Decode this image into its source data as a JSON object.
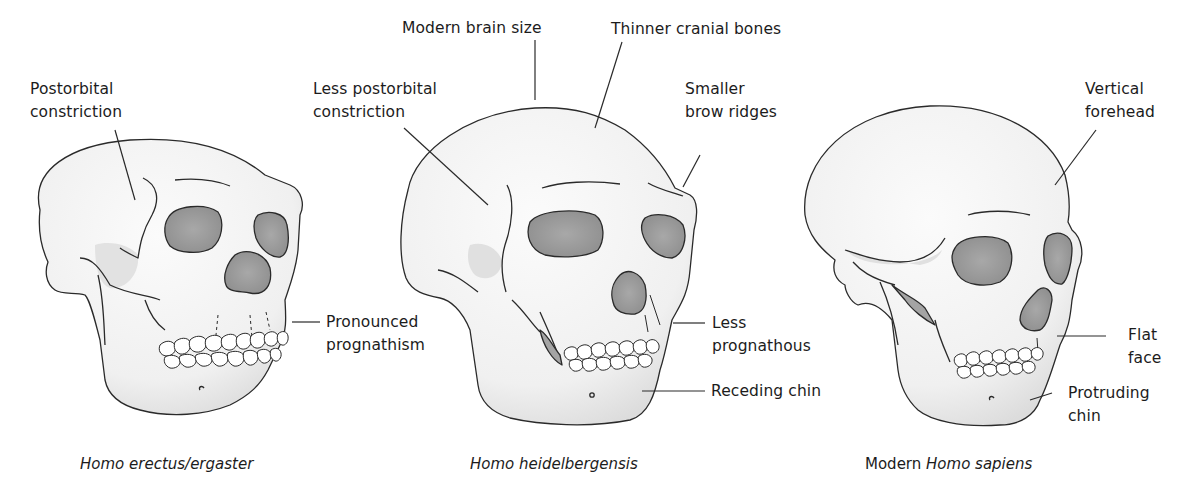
{
  "figure": {
    "colors": {
      "bone": "#f4f4f4",
      "bone_shade": "#dedede",
      "cavity": "#9a9a9a",
      "outline": "#2a2a2a",
      "text": "#1c1c1c"
    },
    "skulls": [
      {
        "id": "homo-erectus",
        "caption": {
          "species": "Homo erectus/ergaster",
          "prefix": ""
        },
        "labels": [
          {
            "line1": "Postorbital",
            "line2": "constriction"
          },
          {
            "line1": "Pronounced",
            "line2": "prognathism"
          }
        ]
      },
      {
        "id": "homo-heidelbergensis",
        "caption": {
          "species": "Homo heidelbergensis",
          "prefix": ""
        },
        "labels": [
          {
            "line1": "Modern brain size",
            "line2": ""
          },
          {
            "line1": "Thinner cranial bones",
            "line2": ""
          },
          {
            "line1": "Less postorbital",
            "line2": "constriction"
          },
          {
            "line1": "Smaller",
            "line2": "brow ridges"
          },
          {
            "line1": "Less",
            "line2": "prognathous"
          },
          {
            "line1": "Receding chin",
            "line2": ""
          }
        ]
      },
      {
        "id": "homo-sapiens",
        "caption": {
          "species": "Homo sapiens",
          "prefix": "Modern "
        },
        "labels": [
          {
            "line1": "Vertical",
            "line2": "forehead"
          },
          {
            "line1": "Flat",
            "line2": "face"
          },
          {
            "line1": "Protruding",
            "line2": "chin"
          }
        ]
      }
    ]
  }
}
